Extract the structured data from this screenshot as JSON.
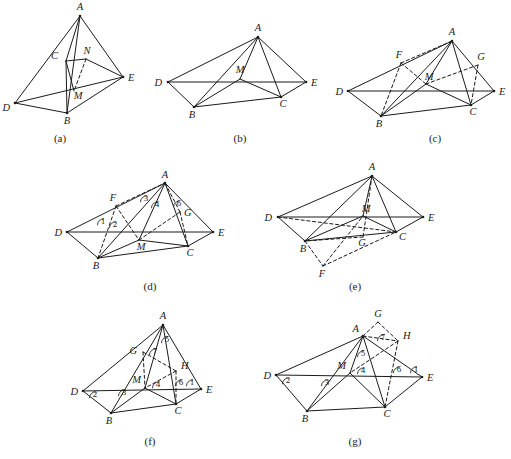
{
  "figure": {
    "background_color": "#ffffff",
    "ink_color": "#1b1b1b",
    "width": 511,
    "height": 459
  },
  "panels": [
    {
      "id": "a",
      "caption": "(a)",
      "caption_x": 60,
      "caption_y": 142,
      "vertices": [
        {
          "name": "A",
          "x": 80,
          "y": 16,
          "lx": 80,
          "ly": 10,
          "anchor": "middle",
          "dot": true
        },
        {
          "name": "C",
          "x": 66,
          "y": 61,
          "lx": 58,
          "ly": 59,
          "anchor": "end",
          "dot": false
        },
        {
          "name": "N",
          "x": 86,
          "y": 59,
          "lx": 87,
          "ly": 54,
          "anchor": "middle",
          "dot": false
        },
        {
          "name": "E",
          "x": 123,
          "y": 77,
          "lx": 128,
          "ly": 81,
          "anchor": "start",
          "dot": true
        },
        {
          "name": "M",
          "x": 74,
          "y": 91,
          "lx": 78,
          "ly": 99,
          "anchor": "middle",
          "dot": false
        },
        {
          "name": "D",
          "x": 15,
          "y": 103,
          "lx": 10,
          "ly": 111,
          "anchor": "end",
          "dot": true
        },
        {
          "name": "B",
          "x": 67,
          "y": 113,
          "lx": 67,
          "ly": 124,
          "anchor": "middle",
          "dot": true
        }
      ],
      "solid_edges": [
        [
          "A",
          "D"
        ],
        [
          "A",
          "E"
        ],
        [
          "A",
          "B"
        ],
        [
          "A",
          "C"
        ],
        [
          "D",
          "B"
        ],
        [
          "D",
          "E"
        ],
        [
          "B",
          "E"
        ],
        [
          "B",
          "C"
        ],
        [
          "C",
          "N"
        ],
        [
          "N",
          "E"
        ],
        [
          "C",
          "M"
        ]
      ],
      "dashed_edges": [
        [
          "N",
          "M"
        ]
      ],
      "angle_numbers": []
    },
    {
      "id": "b",
      "caption": "(b)",
      "caption_x": 240,
      "caption_y": 142,
      "vertices": [
        {
          "name": "A",
          "x": 258,
          "y": 37,
          "lx": 258,
          "ly": 31,
          "anchor": "middle",
          "dot": true
        },
        {
          "name": "D",
          "x": 168,
          "y": 82,
          "lx": 162,
          "ly": 86,
          "anchor": "end",
          "dot": true
        },
        {
          "name": "M",
          "x": 240,
          "y": 79,
          "lx": 240,
          "ly": 73,
          "anchor": "middle",
          "dot": false
        },
        {
          "name": "E",
          "x": 306,
          "y": 82,
          "lx": 311,
          "ly": 86,
          "anchor": "start",
          "dot": true
        },
        {
          "name": "C",
          "x": 281,
          "y": 97,
          "lx": 283,
          "ly": 107,
          "anchor": "middle",
          "dot": true
        },
        {
          "name": "B",
          "x": 194,
          "y": 107,
          "lx": 192,
          "ly": 118,
          "anchor": "middle",
          "dot": true
        }
      ],
      "solid_edges": [
        [
          "A",
          "D"
        ],
        [
          "A",
          "E"
        ],
        [
          "A",
          "B"
        ],
        [
          "A",
          "C"
        ],
        [
          "A",
          "M"
        ],
        [
          "D",
          "E"
        ],
        [
          "D",
          "B"
        ],
        [
          "B",
          "C"
        ],
        [
          "B",
          "M"
        ],
        [
          "C",
          "E"
        ],
        [
          "C",
          "M"
        ]
      ],
      "dashed_edges": [],
      "angle_numbers": []
    },
    {
      "id": "c",
      "caption": "(c)",
      "caption_x": 435,
      "caption_y": 142,
      "vertices": [
        {
          "name": "A",
          "x": 452,
          "y": 41,
          "lx": 452,
          "ly": 35,
          "anchor": "middle",
          "dot": true
        },
        {
          "name": "F",
          "x": 401,
          "y": 63,
          "lx": 399,
          "ly": 58,
          "anchor": "middle",
          "dot": false
        },
        {
          "name": "G",
          "x": 478,
          "y": 65,
          "lx": 481,
          "ly": 60,
          "anchor": "middle",
          "dot": false
        },
        {
          "name": "D",
          "x": 348,
          "y": 91,
          "lx": 343,
          "ly": 95,
          "anchor": "end",
          "dot": true
        },
        {
          "name": "M",
          "x": 426,
          "y": 84,
          "lx": 429,
          "ly": 80,
          "anchor": "middle",
          "dot": false
        },
        {
          "name": "E",
          "x": 494,
          "y": 91,
          "lx": 499,
          "ly": 95,
          "anchor": "start",
          "dot": true
        },
        {
          "name": "C",
          "x": 471,
          "y": 105,
          "lx": 473,
          "ly": 115,
          "anchor": "middle",
          "dot": true
        },
        {
          "name": "B",
          "x": 381,
          "y": 116,
          "lx": 379,
          "ly": 127,
          "anchor": "middle",
          "dot": true
        }
      ],
      "solid_edges": [
        [
          "A",
          "D"
        ],
        [
          "A",
          "E"
        ],
        [
          "A",
          "B"
        ],
        [
          "A",
          "C"
        ],
        [
          "A",
          "M"
        ],
        [
          "D",
          "E"
        ],
        [
          "D",
          "B"
        ],
        [
          "B",
          "C"
        ],
        [
          "B",
          "M"
        ],
        [
          "C",
          "E"
        ],
        [
          "C",
          "M"
        ]
      ],
      "dashed_edges": [
        [
          "F",
          "B"
        ],
        [
          "F",
          "A"
        ],
        [
          "F",
          "M"
        ],
        [
          "G",
          "C"
        ],
        [
          "G",
          "M"
        ]
      ],
      "angle_numbers": []
    },
    {
      "id": "d",
      "caption": "(d)",
      "caption_x": 150,
      "caption_y": 290,
      "vertices": [
        {
          "name": "A",
          "x": 165,
          "y": 183,
          "lx": 165,
          "ly": 178,
          "anchor": "middle",
          "dot": true
        },
        {
          "name": "F",
          "x": 116,
          "y": 206,
          "lx": 113,
          "ly": 201,
          "anchor": "middle",
          "dot": false
        },
        {
          "name": "G",
          "x": 180,
          "y": 212,
          "lx": 184,
          "ly": 216,
          "anchor": "start",
          "dot": false
        },
        {
          "name": "D",
          "x": 67,
          "y": 232,
          "lx": 62,
          "ly": 236,
          "anchor": "end",
          "dot": true
        },
        {
          "name": "M",
          "x": 139,
          "y": 240,
          "lx": 141,
          "ly": 250,
          "anchor": "middle",
          "dot": false
        },
        {
          "name": "E",
          "x": 213,
          "y": 232,
          "lx": 218,
          "ly": 236,
          "anchor": "start",
          "dot": true
        },
        {
          "name": "C",
          "x": 188,
          "y": 246,
          "lx": 190,
          "ly": 256,
          "anchor": "middle",
          "dot": true
        },
        {
          "name": "B",
          "x": 98,
          "y": 258,
          "lx": 96,
          "ly": 269,
          "anchor": "middle",
          "dot": true
        }
      ],
      "solid_edges": [
        [
          "A",
          "D"
        ],
        [
          "A",
          "E"
        ],
        [
          "A",
          "B"
        ],
        [
          "A",
          "C"
        ],
        [
          "A",
          "M"
        ],
        [
          "D",
          "E"
        ],
        [
          "D",
          "B"
        ],
        [
          "B",
          "C"
        ],
        [
          "B",
          "M"
        ],
        [
          "C",
          "E"
        ],
        [
          "C",
          "M"
        ]
      ],
      "dashed_edges": [
        [
          "F",
          "B"
        ],
        [
          "F",
          "A"
        ],
        [
          "F",
          "M"
        ],
        [
          "G",
          "C"
        ],
        [
          "G",
          "M"
        ],
        [
          "G",
          "A"
        ]
      ],
      "angle_numbers": [
        {
          "label": "1",
          "x": 103,
          "y": 224
        },
        {
          "label": "2",
          "x": 115,
          "y": 227
        },
        {
          "label": "3",
          "x": 146,
          "y": 201
        },
        {
          "label": "4",
          "x": 157,
          "y": 207
        },
        {
          "label": "6",
          "x": 179,
          "y": 206
        }
      ]
    },
    {
      "id": "e",
      "caption": "(e)",
      "caption_x": 355,
      "caption_y": 290,
      "vertices": [
        {
          "name": "A",
          "x": 372,
          "y": 176,
          "lx": 372,
          "ly": 170,
          "anchor": "middle",
          "dot": true
        },
        {
          "name": "D",
          "x": 278,
          "y": 217,
          "lx": 272,
          "ly": 221,
          "anchor": "end",
          "dot": true
        },
        {
          "name": "M",
          "x": 363,
          "y": 216,
          "lx": 366,
          "ly": 212,
          "anchor": "middle",
          "dot": false
        },
        {
          "name": "E",
          "x": 423,
          "y": 217,
          "lx": 428,
          "ly": 221,
          "anchor": "start",
          "dot": true
        },
        {
          "name": "C",
          "x": 396,
          "y": 232,
          "lx": 399,
          "ly": 240,
          "anchor": "start",
          "dot": true
        },
        {
          "name": "G",
          "x": 363,
          "y": 237,
          "lx": 362,
          "ly": 246,
          "anchor": "middle",
          "dot": false
        },
        {
          "name": "B",
          "x": 305,
          "y": 241,
          "lx": 303,
          "ly": 252,
          "anchor": "middle",
          "dot": true
        },
        {
          "name": "F",
          "x": 323,
          "y": 266,
          "lx": 322,
          "ly": 277,
          "anchor": "middle",
          "dot": false
        }
      ],
      "solid_edges": [
        [
          "A",
          "D"
        ],
        [
          "A",
          "E"
        ],
        [
          "A",
          "B"
        ],
        [
          "A",
          "C"
        ],
        [
          "A",
          "M"
        ],
        [
          "D",
          "E"
        ],
        [
          "D",
          "B"
        ],
        [
          "B",
          "C"
        ],
        [
          "B",
          "M"
        ],
        [
          "C",
          "E"
        ],
        [
          "C",
          "M"
        ]
      ],
      "dashed_edges": [
        [
          "A",
          "G"
        ],
        [
          "D",
          "C"
        ],
        [
          "B",
          "F"
        ],
        [
          "F",
          "C"
        ],
        [
          "F",
          "M"
        ],
        [
          "G",
          "B"
        ]
      ],
      "angle_numbers": []
    },
    {
      "id": "f",
      "caption": "(f)",
      "caption_x": 150,
      "caption_y": 445,
      "vertices": [
        {
          "name": "A",
          "x": 163,
          "y": 325,
          "lx": 163,
          "ly": 319,
          "anchor": "middle",
          "dot": true
        },
        {
          "name": "G",
          "x": 143,
          "y": 352,
          "lx": 137,
          "ly": 354,
          "anchor": "end",
          "dot": false
        },
        {
          "name": "H",
          "x": 176,
          "y": 371,
          "lx": 181,
          "ly": 369,
          "anchor": "start",
          "dot": false
        },
        {
          "name": "D",
          "x": 83,
          "y": 391,
          "lx": 78,
          "ly": 395,
          "anchor": "end",
          "dot": true
        },
        {
          "name": "M",
          "x": 145,
          "y": 388,
          "lx": 141,
          "ly": 383,
          "anchor": "end",
          "dot": false
        },
        {
          "name": "E",
          "x": 201,
          "y": 389,
          "lx": 206,
          "ly": 393,
          "anchor": "start",
          "dot": true
        },
        {
          "name": "C",
          "x": 176,
          "y": 404,
          "lx": 178,
          "ly": 414,
          "anchor": "middle",
          "dot": true
        },
        {
          "name": "B",
          "x": 111,
          "y": 413,
          "lx": 109,
          "ly": 424,
          "anchor": "middle",
          "dot": true
        }
      ],
      "solid_edges": [
        [
          "A",
          "D"
        ],
        [
          "A",
          "E"
        ],
        [
          "A",
          "B"
        ],
        [
          "A",
          "C"
        ],
        [
          "A",
          "M"
        ],
        [
          "D",
          "E"
        ],
        [
          "D",
          "B"
        ],
        [
          "B",
          "C"
        ],
        [
          "B",
          "M"
        ],
        [
          "C",
          "E"
        ],
        [
          "C",
          "M"
        ]
      ],
      "dashed_edges": [
        [
          "G",
          "H"
        ],
        [
          "G",
          "M"
        ],
        [
          "H",
          "M"
        ],
        [
          "H",
          "C"
        ]
      ],
      "angle_numbers": [
        {
          "label": "5",
          "x": 167,
          "y": 342
        },
        {
          "label": "7",
          "x": 155,
          "y": 354
        },
        {
          "label": "2",
          "x": 95,
          "y": 397
        },
        {
          "label": "3",
          "x": 124,
          "y": 395
        },
        {
          "label": "4",
          "x": 158,
          "y": 387
        },
        {
          "label": "6",
          "x": 181,
          "y": 385
        },
        {
          "label": "1",
          "x": 192,
          "y": 385
        }
      ]
    },
    {
      "id": "g",
      "caption": "(g)",
      "caption_x": 355,
      "caption_y": 445,
      "vertices": [
        {
          "name": "G",
          "x": 378,
          "y": 322,
          "lx": 378,
          "ly": 317,
          "anchor": "middle",
          "dot": false
        },
        {
          "name": "A",
          "x": 363,
          "y": 336,
          "lx": 359,
          "ly": 332,
          "anchor": "end",
          "dot": true
        },
        {
          "name": "H",
          "x": 398,
          "y": 341,
          "lx": 403,
          "ly": 339,
          "anchor": "start",
          "dot": false
        },
        {
          "name": "D",
          "x": 276,
          "y": 375,
          "lx": 271,
          "ly": 379,
          "anchor": "end",
          "dot": true
        },
        {
          "name": "M",
          "x": 350,
          "y": 373,
          "lx": 346,
          "ly": 369,
          "anchor": "end",
          "dot": false
        },
        {
          "name": "E",
          "x": 422,
          "y": 377,
          "lx": 427,
          "ly": 381,
          "anchor": "start",
          "dot": true
        },
        {
          "name": "C",
          "x": 385,
          "y": 407,
          "lx": 387,
          "ly": 417,
          "anchor": "middle",
          "dot": true
        },
        {
          "name": "B",
          "x": 307,
          "y": 411,
          "lx": 305,
          "ly": 422,
          "anchor": "middle",
          "dot": true
        }
      ],
      "solid_edges": [
        [
          "A",
          "D"
        ],
        [
          "A",
          "E"
        ],
        [
          "A",
          "B"
        ],
        [
          "A",
          "C"
        ],
        [
          "A",
          "M"
        ],
        [
          "D",
          "E"
        ],
        [
          "D",
          "B"
        ],
        [
          "B",
          "C"
        ],
        [
          "B",
          "M"
        ],
        [
          "C",
          "E"
        ],
        [
          "C",
          "M"
        ]
      ],
      "dashed_edges": [
        [
          "G",
          "A"
        ],
        [
          "G",
          "H"
        ],
        [
          "H",
          "C"
        ],
        [
          "H",
          "M"
        ],
        [
          "A",
          "H"
        ]
      ],
      "angle_numbers": [
        {
          "label": "7",
          "x": 383,
          "y": 340
        },
        {
          "label": "5",
          "x": 363,
          "y": 356
        },
        {
          "label": "4",
          "x": 363,
          "y": 373
        },
        {
          "label": "2",
          "x": 288,
          "y": 383
        },
        {
          "label": "3",
          "x": 327,
          "y": 385
        },
        {
          "label": "6",
          "x": 399,
          "y": 372
        },
        {
          "label": "1",
          "x": 416,
          "y": 372
        }
      ]
    }
  ]
}
